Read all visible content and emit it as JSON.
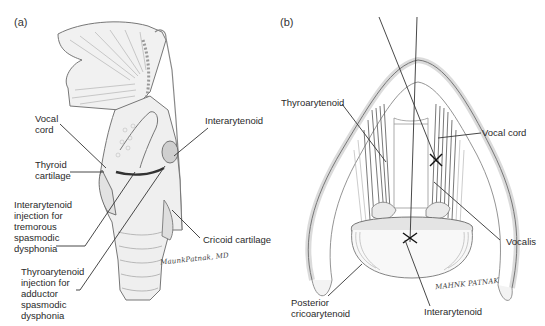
{
  "figure": {
    "panels": [
      {
        "id": "a",
        "letter": "(a)",
        "view": "sagittal larynx",
        "labels": {
          "vocal_cord": "Vocal\ncord",
          "thyroid_cartilage": "Thyroid\ncartilage",
          "interarytenoid": "Interarytenoid",
          "interarytenoid_injection": "Interarytenoid\ninjection for\ntremorous\nspasmodic\ndysphonia",
          "cricoid_cartilage": "Cricoid cartilage",
          "thyroarytenoid_injection": "Thyroarytenoid\ninjection for\nadductor\nspasmodic\ndysphonia"
        },
        "signature": "MaunkPatnak, MD"
      },
      {
        "id": "b",
        "letter": "(b)",
        "view": "superior laryngoscopic",
        "labels": {
          "thyroarytenoid": "Thyroarytenoid",
          "vocal_cord": "Vocal cord",
          "vocalis": "Vocalis",
          "posterior_cricoarytenoid": "Posterior\ncricoarytenoid",
          "interarytenoid": "Interarytenoid"
        },
        "signature": "MAHNK PATNAK"
      }
    ],
    "colors": {
      "ink": "#2a2a2a",
      "shade": "#9a9a9a",
      "light": "#d6d6d6",
      "background": "#ffffff"
    }
  }
}
